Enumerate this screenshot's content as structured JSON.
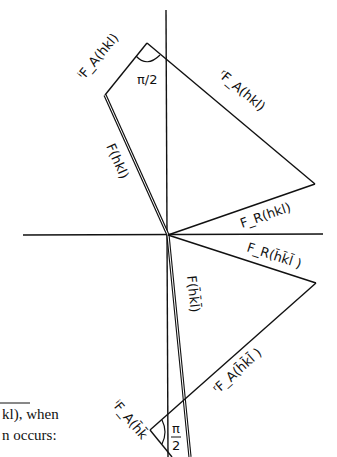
{
  "diagram": {
    "labels": {
      "iFA_hkl": "ⁱF_A(hkl)",
      "rFA_hkl": "ʳF_A(hkl)",
      "F_hkl": "F(hkl)",
      "FR_hkl": "F_R(hkl)",
      "FR_bar": "F_R(h̄k̄l̄ )",
      "F_bar": "F(h̄k̄l̄)",
      "rFA_bar": "ʳF_A(h̄k̄l̄ )",
      "iFA_bar": "ⁱF_A(h̄k̄",
      "angle_top": "π/2",
      "angle_bottom_num": "π",
      "angle_bottom_den": "2"
    },
    "caption": {
      "line1": "kl), when",
      "line2": "n occurs:"
    }
  }
}
